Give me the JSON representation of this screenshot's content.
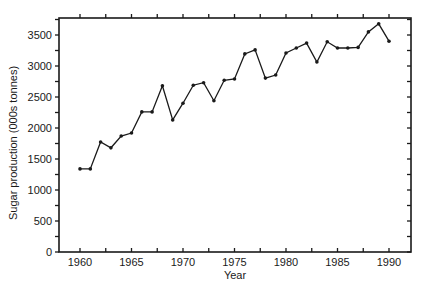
{
  "chart_data": {
    "type": "line",
    "title": "",
    "xlabel": "Year",
    "ylabel": "Sugar production (000s tonnes)",
    "xlim": [
      1958,
      1992
    ],
    "ylim": [
      0,
      3750
    ],
    "x_ticks": [
      1960,
      1965,
      1970,
      1975,
      1980,
      1985,
      1990
    ],
    "y_ticks": [
      0,
      500,
      1000,
      1500,
      2000,
      2500,
      3000,
      3500
    ],
    "grid": false,
    "legend": null,
    "series": [
      {
        "name": "Sugar production",
        "color": "#1a1a1a",
        "marker": "dot",
        "x": [
          1960,
          1961,
          1962,
          1963,
          1964,
          1965,
          1966,
          1967,
          1968,
          1969,
          1970,
          1971,
          1972,
          1973,
          1974,
          1975,
          1976,
          1977,
          1978,
          1979,
          1980,
          1981,
          1982,
          1983,
          1984,
          1985,
          1986,
          1987,
          1988,
          1989,
          1990
        ],
        "values": [
          1340,
          1340,
          1775,
          1680,
          1870,
          1920,
          2260,
          2260,
          2680,
          2130,
          2400,
          2690,
          2730,
          2440,
          2770,
          2790,
          3195,
          3260,
          2805,
          2855,
          3210,
          3290,
          3370,
          3065,
          3390,
          3290,
          3290,
          3300,
          3550,
          3680,
          3400
        ]
      }
    ]
  }
}
